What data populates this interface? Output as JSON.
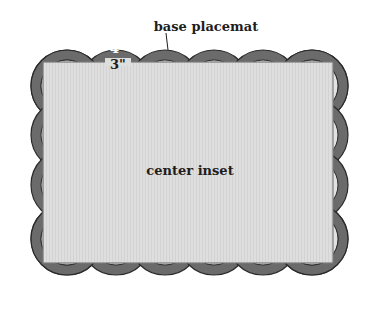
{
  "diagram": {
    "labels": {
      "base": "base placemat",
      "inset": "center inset",
      "outer_dim": "4\"",
      "inner_dim": "3\""
    },
    "colors": {
      "background": "#ffffff",
      "scallop_band": "#6b6b6b",
      "scallop_outline": "#2a2a2a",
      "scallop_fill_inner": "#e2e2e2",
      "inset_fill": "#dcdcdc",
      "inset_border": "#7a7a7a",
      "label_text": "#1e1e1e",
      "dim_outer_text": "#ffffff",
      "dim_inner_text": "#1e1e1e"
    },
    "layout": {
      "scallops_per_long_side": 6,
      "scallops_per_short_side": 4
    }
  }
}
